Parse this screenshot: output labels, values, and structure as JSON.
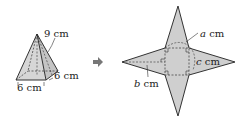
{
  "pyramid": {
    "slant_label": "9 cm",
    "base_side_label": "6 cm",
    "base_depth_label": "6 cm"
  },
  "arrow": {
    "icon": "right-arrow-icon"
  },
  "net": {
    "a_var": "a",
    "a_unit": " cm",
    "b_var": "b",
    "b_unit": " cm",
    "c_var": "c",
    "c_unit": " cm"
  },
  "colors": {
    "fill": "#cfcfcf",
    "stroke": "#333333",
    "arrow": "#777777"
  }
}
